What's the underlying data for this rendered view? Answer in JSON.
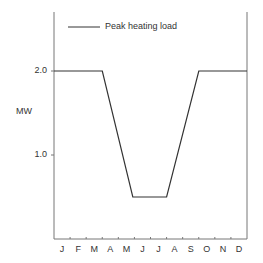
{
  "chart_data": {
    "type": "line",
    "title": "",
    "xlabel": "",
    "ylabel": "MW",
    "categories": [
      "J",
      "F",
      "M",
      "A",
      "M",
      "J",
      "J",
      "A",
      "S",
      "O",
      "N",
      "D"
    ],
    "series": [
      {
        "name": "Peak heating load",
        "color": "#333333",
        "points": [
          {
            "month": 0.0,
            "value": 2.0
          },
          {
            "month": 3.0,
            "value": 2.0
          },
          {
            "month": 4.9,
            "value": 0.5
          },
          {
            "month": 7.0,
            "value": 0.5
          },
          {
            "month": 9.0,
            "value": 2.0
          },
          {
            "month": 12.0,
            "value": 2.0
          }
        ]
      }
    ],
    "yticks": [
      "1.0",
      "2.0"
    ],
    "ylim": [
      0,
      2.7
    ],
    "xlim": [
      0,
      12
    ],
    "grid": false,
    "legend_position": "top-left inside"
  },
  "legend": {
    "label": "Peak heating load"
  },
  "axis": {
    "ylabel": "MW",
    "yticks": [
      {
        "label": "2.0",
        "value": 2.0
      },
      {
        "label": "1.0",
        "value": 1.0
      }
    ],
    "months": [
      "J",
      "F",
      "M",
      "A",
      "M",
      "J",
      "J",
      "A",
      "S",
      "O",
      "N",
      "D"
    ]
  }
}
